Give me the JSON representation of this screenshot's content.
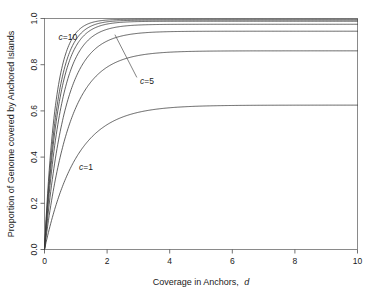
{
  "chart_data": {
    "type": "line",
    "title": "",
    "subtitle": "",
    "xlabel": "Coverage in Anchors, d",
    "xlabel_plain": "Coverage in Anchors,",
    "xlabel_italic": "d",
    "ylabel": "Proportion of Genome covered by Anchored Islands",
    "xlim": [
      0,
      10
    ],
    "ylim": [
      0,
      1
    ],
    "xticks": [
      0,
      2,
      4,
      6,
      8,
      10
    ],
    "xtick_labels": [
      "0",
      "2",
      "4",
      "6",
      "8",
      "10"
    ],
    "yticks": [
      0.0,
      0.2,
      0.4,
      0.6,
      0.8,
      1.0
    ],
    "ytick_labels": [
      "0.0",
      "0.2",
      "0.4",
      "0.6",
      "0.8",
      "1.0"
    ],
    "grid": false,
    "legend": "none",
    "line_color": "#3a3a3a",
    "annotations": [
      {
        "text": "c=10",
        "italic_part": "c",
        "rest": "=10",
        "x_data": 0.45,
        "y_data": 0.905,
        "leader": false
      },
      {
        "text": "c=5",
        "italic_part": "c",
        "rest": "=5",
        "x_data": 3.05,
        "y_data": 0.715,
        "leader": true,
        "leader_from_x": 2.25,
        "leader_from_y": 0.93,
        "leader_to_x": 2.95,
        "leader_to_y": 0.745
      },
      {
        "text": "c=1",
        "italic_part": "c",
        "rest": "=1",
        "x_data": 1.1,
        "y_data": 0.345,
        "leader": false
      }
    ],
    "series": [
      {
        "name": "c=1",
        "c": 1,
        "asymptote": 0.625,
        "rate": 1.0
      },
      {
        "name": "c=2",
        "c": 2,
        "asymptote": 0.86,
        "rate": 1.25
      },
      {
        "name": "c=3",
        "c": 3,
        "asymptote": 0.945,
        "rate": 1.55
      },
      {
        "name": "c=5",
        "c": 5,
        "asymptote": 0.975,
        "rate": 1.9
      },
      {
        "name": "c=7",
        "c": 7,
        "asymptote": 0.988,
        "rate": 2.2
      },
      {
        "name": "c=8",
        "c": 8,
        "asymptote": 0.993,
        "rate": 2.45
      },
      {
        "name": "c=10",
        "c": 10,
        "asymptote": 0.997,
        "rate": 2.8
      }
    ],
    "x_samples": [
      0,
      0.1,
      0.2,
      0.3,
      0.4,
      0.5,
      0.75,
      1,
      1.25,
      1.5,
      1.75,
      2,
      2.5,
      3,
      3.5,
      4,
      5,
      6,
      7,
      8,
      9,
      10
    ],
    "series_values": {
      "c=1": [
        0.0,
        0.059,
        0.113,
        0.162,
        0.206,
        0.246,
        0.33,
        0.395,
        0.446,
        0.486,
        0.517,
        0.541,
        0.574,
        0.594,
        0.606,
        0.614,
        0.621,
        0.624,
        0.625,
        0.625,
        0.625,
        0.625
      ],
      "c=2": [
        0.0,
        0.101,
        0.19,
        0.269,
        0.338,
        0.399,
        0.524,
        0.614,
        0.68,
        0.728,
        0.763,
        0.789,
        0.822,
        0.84,
        0.85,
        0.855,
        0.859,
        0.86,
        0.86,
        0.86,
        0.86,
        0.86
      ],
      "c=3": [
        0.0,
        0.135,
        0.251,
        0.351,
        0.436,
        0.51,
        0.653,
        0.751,
        0.818,
        0.864,
        0.896,
        0.917,
        0.942,
        0.953,
        0.958,
        0.961,
        0.962,
        0.962,
        0.962,
        0.962,
        0.962,
        0.962
      ],
      "c=5": [
        0.0,
        0.169,
        0.309,
        0.425,
        0.521,
        0.6,
        0.748,
        0.843,
        0.903,
        0.941,
        0.965,
        0.98,
        0.994,
        0.998,
        0.999,
        1.0,
        1.0,
        1.0,
        1.0,
        1.0,
        1.0,
        1.0
      ],
      "c=7": [
        0.0,
        0.196,
        0.354,
        0.481,
        0.584,
        0.667,
        0.814,
        0.9,
        0.949,
        0.977,
        0.993,
        1.002,
        1.008,
        1.009,
        1.009,
        1.009,
        1.009,
        1.009,
        1.009,
        1.009,
        1.009,
        1.009
      ],
      "c=8": [
        0.0,
        0.21,
        0.377,
        0.509,
        0.615,
        0.699,
        0.844,
        0.926,
        0.97,
        0.994,
        1.007,
        1.013,
        1.016,
        1.017,
        1.017,
        1.017,
        1.017,
        1.017,
        1.017,
        1.017,
        1.017,
        1.017
      ],
      "c=10": [
        0.0,
        0.235,
        0.416,
        0.555,
        0.664,
        0.748,
        0.888,
        0.96,
        0.995,
        1.012,
        1.02,
        1.024,
        1.026,
        1.026,
        1.026,
        1.026,
        1.026,
        1.026,
        1.026,
        1.026,
        1.026,
        1.026
      ]
    },
    "plateau_levels_observed": [
      0.625,
      0.86,
      0.945,
      0.968,
      0.984,
      0.99,
      0.995
    ]
  }
}
